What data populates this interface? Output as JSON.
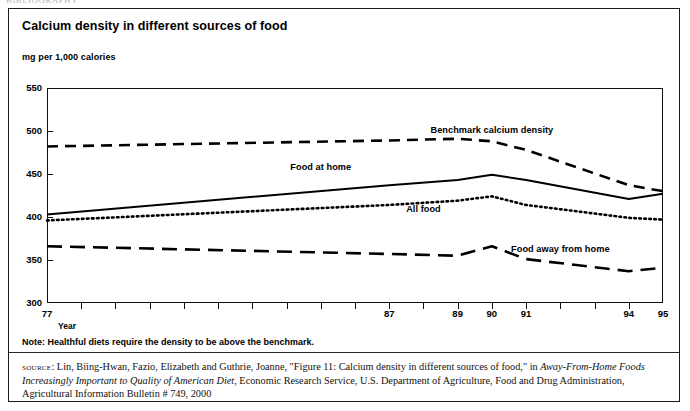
{
  "page": {
    "top_cut_text": "BIBLIOGRAPHY"
  },
  "figure": {
    "title": "Calcium density in different sources of food",
    "unit_label": "mg per 1,000 calories",
    "year_caption": "Year",
    "note": "Note: Healthful diets require the density to be above the benchmark.",
    "source_prefix": "source",
    "source_text_1": ": Lin, Biing-Hwan, Fazio, Elizabeth and Guthrie, Joanne, \"Figure 11: Calcium density in different sources of food,\" in ",
    "source_italic_1": "Away-From-Home Foods Increasingly Important to Quality of American Diet",
    "source_text_2": ", Economic Research Service, U.S. Department of Agriculture, Food and Drug Administration, Agricultural Information Bulletin # 749, 2000"
  },
  "chart_data": {
    "type": "line",
    "title": "Calcium density in different sources of food",
    "xlabel": "Year",
    "ylabel": "mg per 1,000 calories",
    "ylim": [
      300,
      550
    ],
    "yticks": [
      300,
      350,
      400,
      450,
      500,
      550
    ],
    "xlim": [
      77,
      95
    ],
    "xticks": [
      77,
      78,
      79,
      80,
      81,
      82,
      83,
      84,
      85,
      86,
      87,
      88,
      89,
      90,
      91,
      92,
      93,
      94,
      95
    ],
    "xtick_labels": [
      "77",
      "",
      "",
      "",
      "",
      "",
      "",
      "",
      "",
      "",
      "87",
      "",
      "89",
      "90",
      "91",
      "",
      "",
      "94",
      "95"
    ],
    "grid": false,
    "legend_position": "inline-annotations",
    "x": [
      77,
      87,
      89,
      90,
      91,
      94,
      95
    ],
    "series": [
      {
        "name": "Benchmark calcium density",
        "style": "dashed",
        "values": [
          482,
          489,
          491,
          488,
          478,
          437,
          430
        ],
        "label_x": 90,
        "label_y": 500
      },
      {
        "name": "Food at home",
        "style": "solid",
        "values": [
          403,
          437,
          443,
          449,
          443,
          421,
          427
        ],
        "label_x": 85,
        "label_y": 457
      },
      {
        "name": "All food",
        "style": "dotted",
        "values": [
          396,
          414,
          419,
          424,
          414,
          399,
          397
        ],
        "label_x": 88,
        "label_y": 408
      },
      {
        "name": "Food away from home",
        "style": "long-dashed",
        "values": [
          366,
          357,
          355,
          366,
          351,
          337,
          341
        ],
        "label_x": 92,
        "label_y": 362
      }
    ]
  },
  "axis": {
    "y_labels": [
      "550",
      "500",
      "450",
      "400",
      "350",
      "300"
    ],
    "x_labels": [
      "77",
      "87",
      "89",
      "90",
      "91",
      "94",
      "95"
    ]
  }
}
